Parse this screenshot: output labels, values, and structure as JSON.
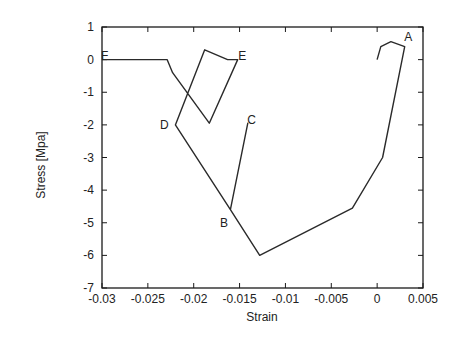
{
  "chart_data": {
    "type": "line",
    "title": "",
    "xlabel": "Strain",
    "ylabel": "Stress [Mpa]",
    "xlim": [
      -0.03,
      0.005
    ],
    "ylim": [
      -7,
      1
    ],
    "grid": false,
    "legend": null,
    "x_ticks": [
      -0.03,
      -0.025,
      -0.02,
      -0.015,
      -0.01,
      -0.005,
      0,
      0.005
    ],
    "x_tick_labels": [
      "-0.03",
      "-0.025",
      "-0.02",
      "-0.015",
      "-0.01",
      "-0.005",
      "0",
      "0.005"
    ],
    "y_ticks": [
      1,
      0,
      -1,
      -2,
      -3,
      -4,
      -5,
      -6,
      -7
    ],
    "y_tick_labels": [
      "1",
      "0",
      "-1",
      "-2",
      "-3",
      "-4",
      "-5",
      "-6",
      "-7"
    ],
    "series": [
      {
        "name": "stress-strain path",
        "x": [
          0.0,
          0.0004,
          0.0015,
          0.003,
          0.0006,
          -0.0027,
          -0.0128,
          -0.016,
          -0.0141,
          -0.016,
          -0.022,
          -0.0188,
          -0.0163,
          -0.0152,
          -0.0183,
          -0.0223,
          -0.0229,
          -0.03
        ],
        "y": [
          0.0,
          0.4,
          0.55,
          0.4,
          -3.0,
          -4.55,
          -6.0,
          -4.6,
          -1.95,
          -4.6,
          -2.0,
          0.3,
          0.0,
          0.0,
          -1.95,
          -0.4,
          0.0,
          0.0
        ]
      }
    ],
    "annotations": [
      {
        "text": "A",
        "x": 0.0034,
        "y": 0.7
      },
      {
        "text": "B",
        "x": -0.0167,
        "y": -5.0
      },
      {
        "text": "C",
        "x": -0.0137,
        "y": -1.85
      },
      {
        "text": "D",
        "x": -0.0232,
        "y": -2.0
      },
      {
        "text": "E",
        "x": -0.0147,
        "y": 0.1
      },
      {
        "text": "F",
        "x": -0.0297,
        "y": 0.1
      }
    ]
  },
  "colors": {
    "line": "#2a2a2a",
    "axis": "#1a1a1a",
    "text": "#222222",
    "background": "#ffffff"
  }
}
